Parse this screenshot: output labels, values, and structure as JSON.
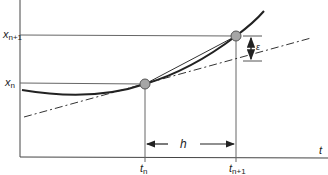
{
  "diagram": {
    "type": "numerical-integration-step",
    "axes": {
      "x_label": "t",
      "x_ticks": [
        {
          "base": "t",
          "sub": "n"
        },
        {
          "base": "t",
          "sub": "n+1"
        }
      ],
      "y_ticks": [
        {
          "base": "x",
          "sub": "n+1"
        },
        {
          "base": "x",
          "sub": "n"
        }
      ]
    },
    "annotations": {
      "step_size": "h",
      "error": "ε"
    },
    "curves": [
      {
        "name": "true-solution",
        "style": "solid-thick"
      },
      {
        "name": "secant-chord",
        "style": "solid-thin"
      },
      {
        "name": "tangent-line",
        "style": "dash-dot"
      }
    ],
    "points": [
      {
        "name": "point-n",
        "color": "#a6a6a6"
      },
      {
        "name": "point-n-plus-1",
        "color": "#a6a6a6"
      }
    ],
    "colors": {
      "line": "#333333",
      "guide": "#555555",
      "point_fill": "#a6a6a6"
    }
  }
}
